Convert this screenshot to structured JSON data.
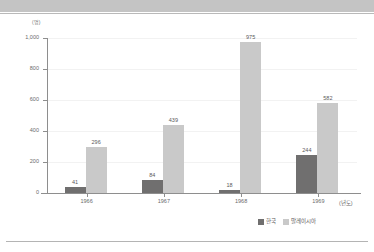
{
  "page": {
    "top_band_color": "#c4c4c4",
    "background_color": "#ffffff"
  },
  "chart_data": {
    "type": "bar",
    "title": "",
    "subtitle": "",
    "xlabel": "(년도)",
    "ylabel": "(명)",
    "categories": [
      "1966",
      "1967",
      "1968",
      "1969"
    ],
    "series": [
      {
        "name": "한국",
        "color": "#706f6f",
        "values": [
          41,
          84,
          18,
          244
        ]
      },
      {
        "name": "말레이시아",
        "color": "#c9c9c9",
        "values": [
          296,
          439,
          975,
          582
        ]
      }
    ],
    "ylim": [
      0,
      1000
    ],
    "ytick_labels": [
      "1,000",
      "800",
      "600",
      "400",
      "200",
      "0"
    ],
    "ytick_values": [
      1000,
      800,
      600,
      400,
      200,
      0
    ],
    "grid": true,
    "legend_position": "bottom-right",
    "data_labels": {
      "korea": [
        "41",
        "84",
        "18",
        "244"
      ],
      "malaysia": [
        "296",
        "439",
        "975",
        "582"
      ]
    }
  },
  "legend": {
    "entries": [
      {
        "label": "한국"
      },
      {
        "label": "말레이시아"
      }
    ]
  }
}
